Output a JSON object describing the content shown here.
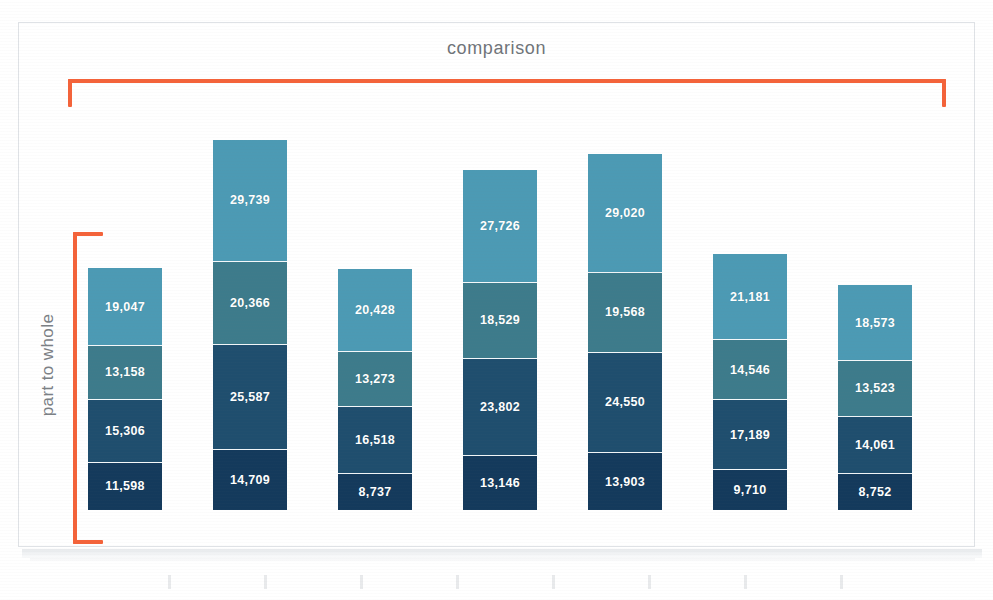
{
  "sheet": {
    "background_color": "#ffffff",
    "border_color": "#dfe2e6"
  },
  "annotations": {
    "title": "comparison",
    "title_color": "#6f7479",
    "axis_caption": "part to whole",
    "axis_caption_color": "#7b8085",
    "bracket_color": "#f4633a"
  },
  "chart_data": {
    "type": "bar",
    "subtype": "stacked-bar",
    "title": "comparison",
    "xlabel": "",
    "ylabel": "part to whole",
    "grid": false,
    "legend": "none",
    "ylim": [
      0,
      90401
    ],
    "categories": [
      "Sun",
      "Mon",
      "Tue",
      "Wed",
      "Thu",
      "Fri",
      "Sat"
    ],
    "stack_order": "top-to-bottom",
    "series": [
      {
        "name": "segment-1",
        "color": "#4c9ab4",
        "values": [
          19047,
          29739,
          20428,
          27726,
          29020,
          21181,
          18573
        ],
        "labels": [
          "19,047",
          "29,739",
          "20,428",
          "27,726",
          "29,020",
          "21,181",
          "18,573"
        ]
      },
      {
        "name": "segment-2",
        "color": "#3d7b8b",
        "values": [
          13158,
          20366,
          13273,
          18529,
          19568,
          14546,
          13523
        ],
        "labels": [
          "13,158",
          "20,366",
          "13,273",
          "18,529",
          "19,568",
          "14,546",
          "13,523"
        ]
      },
      {
        "name": "segment-3",
        "color": "#1f4e6e",
        "values": [
          15306,
          25587,
          16518,
          23802,
          24550,
          17189,
          14061
        ],
        "labels": [
          "15,306",
          "25,587",
          "16,518",
          "23,802",
          "24,550",
          "17,189",
          "14,061"
        ]
      },
      {
        "name": "segment-4",
        "color": "#143a5c",
        "values": [
          11598,
          14709,
          8737,
          13146,
          13903,
          9710,
          8752
        ],
        "labels": [
          "11,598",
          "14,709",
          "8,737",
          "13,146",
          "13,903",
          "9,710",
          "8,752"
        ]
      }
    ],
    "totals": [
      59109,
      90401,
      58956,
      83203,
      87041,
      62626,
      54909
    ]
  }
}
